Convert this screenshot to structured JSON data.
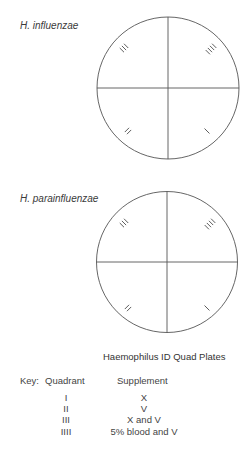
{
  "plates": [
    {
      "title": "H. influenzae",
      "quadrant_marks": {
        "top_left": "III",
        "top_right": "IIII",
        "bottom_left": "II",
        "bottom_right": "I"
      }
    },
    {
      "title": "H. parainfluenzae",
      "quadrant_marks": {
        "top_left": "III",
        "top_right": "IIII",
        "bottom_left": "II",
        "bottom_right": "I"
      }
    }
  ],
  "caption": "Haemophilus ID Quad Plates",
  "key": {
    "label": "Key:",
    "col_quadrant": "Quadrant",
    "col_supplement": "Supplement",
    "rows": [
      {
        "quadrant": "I",
        "supplement": "X"
      },
      {
        "quadrant": "II",
        "supplement": "V"
      },
      {
        "quadrant": "III",
        "supplement": "X and V"
      },
      {
        "quadrant": "IIII",
        "supplement": "5% blood and V"
      }
    ]
  },
  "colors": {
    "line": "#555555",
    "text": "#444444"
  }
}
